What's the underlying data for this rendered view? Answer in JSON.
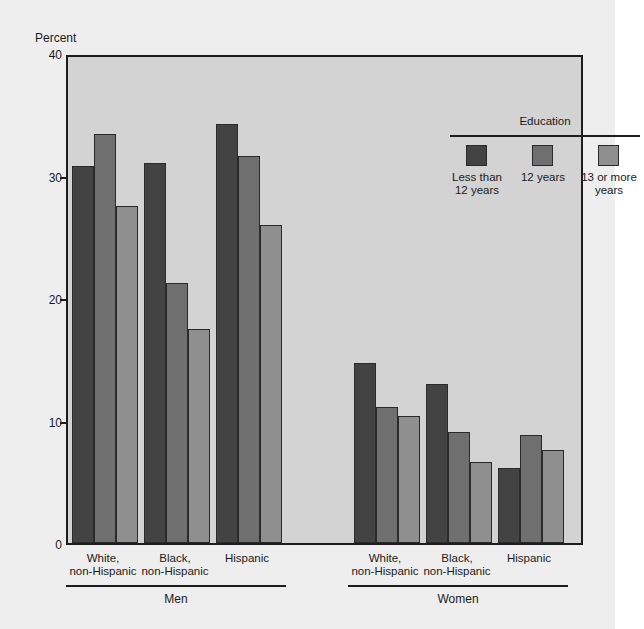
{
  "chart_data": {
    "type": "bar",
    "title": "",
    "subtitle": "",
    "xlabel": "",
    "ylabel": "Percent",
    "ylim": [
      0,
      40
    ],
    "yticks": [
      0,
      10,
      20,
      30,
      40
    ],
    "ytick_labels": [
      "0",
      "10",
      "20",
      "30",
      "40"
    ],
    "grid": false,
    "legend_title": "Education",
    "legend_position": "inside-top-right",
    "categories": [
      "White,\nnon-Hispanic",
      "Black,\nnon-Hispanic",
      "Hispanic",
      "White,\nnon-Hispanic",
      "Black,\nnon-Hispanic",
      "Hispanic"
    ],
    "supergroups": [
      {
        "label": "Men",
        "categories": [
          "White,\nnon-Hispanic",
          "Black,\nnon-Hispanic",
          "Hispanic"
        ]
      },
      {
        "label": "Women",
        "categories": [
          "White,\nnon-Hispanic",
          "Black,\nnon-Hispanic",
          "Hispanic"
        ]
      }
    ],
    "series": [
      {
        "name": "Less than\n12 years",
        "color": "#434343",
        "values": [
          30.8,
          31.0,
          34.2,
          14.7,
          13.0,
          6.1
        ]
      },
      {
        "name": "12 years",
        "color": "#6f6f6f",
        "values": [
          33.4,
          21.2,
          31.6,
          11.1,
          9.1,
          8.8
        ]
      },
      {
        "name": "13 or more\nyears",
        "color": "#8f8f8f",
        "values": [
          27.5,
          17.5,
          26.0,
          10.4,
          6.6,
          7.6
        ]
      }
    ]
  },
  "figure": {
    "background_color": "#eeeeee",
    "plot_background_color": "#d3d3d3",
    "axis_color": "#1d1d1d"
  }
}
